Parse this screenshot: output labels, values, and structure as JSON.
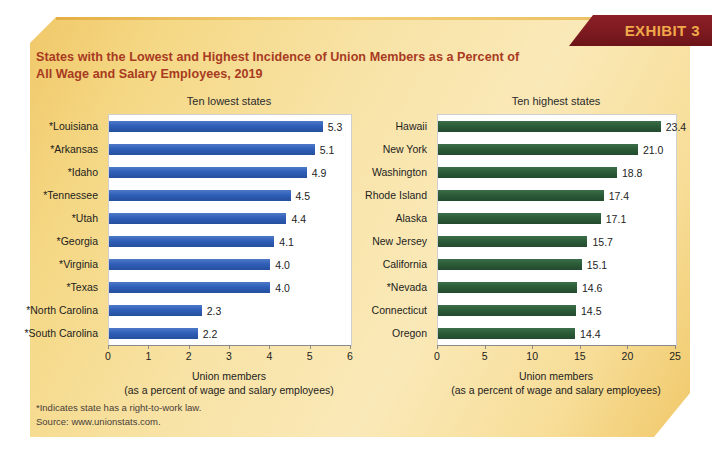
{
  "exhibit": {
    "banner_label": "EXHIBIT 3"
  },
  "title": {
    "line1": "States with the Lowest and Highest Incidence of Union Members as a Percent of",
    "line2": "All Wage and Salary Employees, 2019"
  },
  "footnotes": {
    "line1": "*Indicates state has a right-to-work law.",
    "line2": "Source: www.unionstats.com."
  },
  "colors": {
    "card_background": "#f6de9c",
    "banner_background": "#7c1a20",
    "banner_text": "#f0a94a",
    "title_text": "#a83a22",
    "bar_blue": "#2f5fb8",
    "bar_green": "#2c5c38",
    "plot_background": "#ffffff",
    "axis": "#8a8a8a"
  },
  "chart_data": [
    {
      "type": "bar",
      "orientation": "horizontal",
      "title": "Ten lowest states",
      "xlabel": "Union members",
      "xlabel_sub": "(as a percent of wage and salary employees)",
      "ylabel": "",
      "xlim": [
        0,
        6
      ],
      "xticks": [
        0,
        1,
        2,
        3,
        4,
        5,
        6
      ],
      "xticklabels": [
        "0",
        "1",
        "2",
        "3",
        "4",
        "5",
        "6"
      ],
      "grid": false,
      "legend": false,
      "bar_color": "#2f5fb8",
      "categories": [
        "*Louisiana",
        "*Arkansas",
        "*Idaho",
        "*Tennessee",
        "*Utah",
        "*Georgia",
        "*Virginia",
        "*Texas",
        "*North Carolina",
        "*South Carolina"
      ],
      "values": [
        5.3,
        5.1,
        4.9,
        4.5,
        4.4,
        4.1,
        4.0,
        4.0,
        2.3,
        2.2
      ],
      "value_labels": [
        "5.3",
        "5.1",
        "4.9",
        "4.5",
        "4.4",
        "4.1",
        "4.0",
        "4.0",
        "2.3",
        "2.2"
      ]
    },
    {
      "type": "bar",
      "orientation": "horizontal",
      "title": "Ten highest states",
      "xlabel": "Union members",
      "xlabel_sub": "(as a percent of wage and salary employees)",
      "ylabel": "",
      "xlim": [
        0,
        25
      ],
      "xticks": [
        0,
        5,
        10,
        15,
        20,
        25
      ],
      "xticklabels": [
        "0",
        "5",
        "10",
        "15",
        "20",
        "25"
      ],
      "grid": false,
      "legend": false,
      "bar_color": "#2c5c38",
      "categories": [
        "Hawaii",
        "New York",
        "Washington",
        "Rhode Island",
        "Alaska",
        "New Jersey",
        "California",
        "*Nevada",
        "Connecticut",
        "Oregon"
      ],
      "values": [
        23.4,
        21.0,
        18.8,
        17.4,
        17.1,
        15.7,
        15.1,
        14.6,
        14.5,
        14.4
      ],
      "value_labels": [
        "23.4",
        "21.0",
        "18.8",
        "17.4",
        "17.1",
        "15.7",
        "15.1",
        "14.6",
        "14.5",
        "14.4"
      ]
    }
  ]
}
